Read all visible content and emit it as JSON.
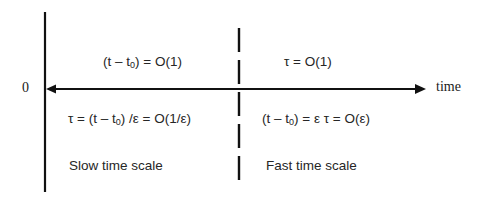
{
  "diagram": {
    "axis": {
      "origin_label": "0",
      "end_label": "time"
    },
    "left_region": {
      "top_expression": "(t – t₀) = O(1)",
      "top_expr_parts": {
        "pre": "(t – t",
        "sub": "0",
        "post": ") = O(1)"
      },
      "bottom_expression": "τ = (t – t₀) /ε = O(1/ε)",
      "bottom_expr_parts": {
        "pre": "τ = (t – t",
        "sub": "0",
        "post": ") /ε = O(1/ε)"
      },
      "caption": "Slow time scale"
    },
    "right_region": {
      "top_expression": "τ = O(1)",
      "bottom_expression": "(t – t₀)  = ε τ = O(ε)",
      "bottom_expr_parts": {
        "pre": "(t – t",
        "sub": "0",
        "post": ")  = ε τ = O(ε)"
      },
      "caption": "Fast time scale"
    },
    "colors": {
      "line": "#111111",
      "text": "#262626",
      "background": "#ffffff"
    }
  }
}
